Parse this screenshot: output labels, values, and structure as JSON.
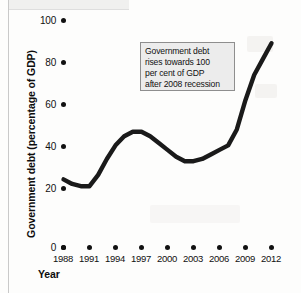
{
  "chart_data": {
    "type": "line",
    "title": "",
    "xlabel": "Year",
    "ylabel": "Government debt (percentage of GDP)",
    "xticklabels": [
      "1988",
      "1991",
      "1994",
      "1997",
      "2000",
      "2003",
      "2006",
      "2009",
      "2012"
    ],
    "yticklabels": [
      "0",
      "20",
      "40",
      "60",
      "80",
      "100"
    ],
    "xlim": [
      1988,
      2012
    ],
    "ylim": [
      0,
      100
    ],
    "grid": false,
    "legend": null,
    "series": [
      {
        "name": "Government debt (percentage of GDP)",
        "color": "#1a1a1a",
        "x": [
          1988,
          1989,
          1990,
          1991,
          1992,
          1993,
          1994,
          1995,
          1996,
          1997,
          1998,
          1999,
          2000,
          2001,
          2002,
          2003,
          2004,
          2005,
          2006,
          2007,
          2008,
          2009,
          2010,
          2011,
          2012
        ],
        "values": [
          30,
          28,
          27,
          27,
          32,
          39,
          45,
          49,
          51,
          51,
          49,
          46,
          43,
          40,
          38,
          38,
          39,
          41,
          43,
          45,
          52,
          65,
          76,
          83,
          90
        ]
      }
    ],
    "annotations": [
      {
        "name": "recession-annotation",
        "lines": [
          "Government debt",
          "rises towards 100",
          "per cent of GDP",
          "after 2008 recession"
        ]
      }
    ]
  },
  "axes": {
    "ylabel": "Government debt (percentage of GDP)",
    "xlabel": "Year",
    "yticks": [
      "100",
      "80",
      "60",
      "40",
      "20",
      "0"
    ],
    "xticks": [
      "1988",
      "1991",
      "1994",
      "1997",
      "2000",
      "2003",
      "2006",
      "2009",
      "2012"
    ]
  },
  "annotation": {
    "line1": "Government debt",
    "line2": "rises towards 100",
    "line3": "per cent of GDP",
    "line4": "after 2008 recession"
  },
  "colors": {
    "series": "#1a1a1a",
    "annotation_fill": "#ececec",
    "annotation_border": "#8e8e8e",
    "text": "#101010",
    "background": "#fdfdfc"
  }
}
